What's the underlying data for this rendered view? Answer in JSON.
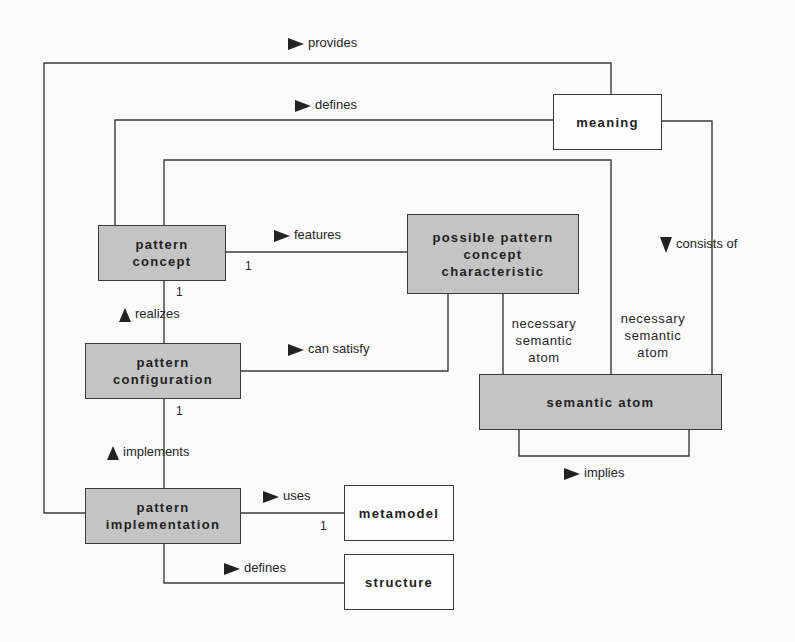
{
  "diagram": {
    "nodes": {
      "meaning": {
        "label": "meaning",
        "fill": "white"
      },
      "pattern_concept": {
        "label": "pattern\nconcept",
        "fill": "#c4c4c4"
      },
      "possible_characteristic": {
        "label": "possible pattern\nconcept\ncharacteristic",
        "fill": "#c4c4c4"
      },
      "pattern_configuration": {
        "label": "pattern\nconfiguration",
        "fill": "#c4c4c4"
      },
      "semantic_atom": {
        "label": "semantic atom",
        "fill": "#c4c4c4"
      },
      "pattern_implementation": {
        "label": "pattern\nimplementation",
        "fill": "#c4c4c4"
      },
      "metamodel": {
        "label": "metamodel",
        "fill": "white"
      },
      "structure": {
        "label": "structure",
        "fill": "white"
      }
    },
    "relations": {
      "provides": {
        "label": "provides",
        "direction": "right",
        "from": "pattern implementation",
        "to": "meaning"
      },
      "defines_meaning": {
        "label": "defines",
        "direction": "right",
        "from": "pattern concept",
        "to": "meaning"
      },
      "features": {
        "label": "features",
        "direction": "right",
        "from": "pattern concept",
        "to": "possible pattern concept characteristic",
        "multiplicity": "1"
      },
      "realizes": {
        "label": "realizes",
        "direction": "up",
        "from": "pattern configuration",
        "to": "pattern concept",
        "multiplicity": "1"
      },
      "can_satisfy": {
        "label": "can satisfy",
        "direction": "right",
        "from": "pattern configuration",
        "to": "possible pattern concept characteristic"
      },
      "implements": {
        "label": "implements",
        "direction": "up",
        "from": "pattern implementation",
        "to": "pattern configuration",
        "multiplicity": "1"
      },
      "uses": {
        "label": "uses",
        "direction": "right",
        "from": "pattern implementation",
        "to": "metamodel",
        "multiplicity": "1"
      },
      "defines_structure": {
        "label": "defines",
        "direction": "right",
        "from": "pattern implementation",
        "to": "structure"
      },
      "consists_of": {
        "label": "consists of",
        "direction": "down",
        "from": "meaning",
        "to": "semantic atom"
      },
      "implies": {
        "label": "implies",
        "direction": "right",
        "from": "semantic atom",
        "to": "semantic atom"
      }
    },
    "roles": {
      "necessary_atom_1": "necessary\nsemantic\natom",
      "necessary_atom_2": "necessary\nsemantic\natom"
    },
    "multiplicities": {
      "features_end": "1",
      "concept_bottom": "1",
      "configuration_bottom": "1",
      "uses_end": "1"
    }
  }
}
